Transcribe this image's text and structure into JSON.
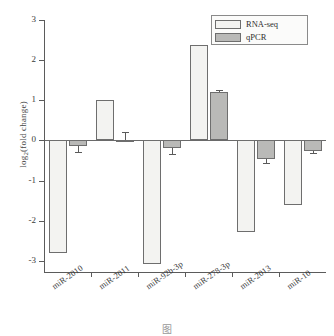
{
  "chart_data": {
    "type": "bar",
    "title": "",
    "xlabel": "",
    "ylabel": "log2(fold change)",
    "ylabel_base": "log",
    "ylabel_sub": "2",
    "ylabel_rest": "(fold change)",
    "ylim": [
      -3.3,
      3.0
    ],
    "yticks": [
      3,
      2,
      1,
      0,
      -1,
      -2,
      -3
    ],
    "ytick_labels": [
      "3",
      "2",
      "1",
      "0",
      "-1",
      "-2",
      "-3"
    ],
    "grid": false,
    "legend_position": "top-right",
    "categories": [
      "miR-2010",
      "miR-2011",
      "miR-92b-3p",
      "miR-278-3p",
      "miR-2013",
      "miR-10"
    ],
    "series": [
      {
        "name": "RNA-seq",
        "color": "#f3f3f1",
        "values": [
          -2.8,
          1.0,
          -3.07,
          2.38,
          -2.28,
          -1.6
        ],
        "errors": [
          0,
          0,
          0,
          0,
          0,
          0
        ]
      },
      {
        "name": "qPCR",
        "color": "#b9b9b7",
        "values": [
          -0.14,
          0.02,
          -0.18,
          1.2,
          -0.45,
          -0.25
        ],
        "errors": [
          0.14,
          0.2,
          0.16,
          0.05,
          0.12,
          0.05
        ]
      }
    ]
  },
  "legend": {
    "items": [
      {
        "label": "RNA-seq",
        "swatch": "rnaseq"
      },
      {
        "label": "qPCR",
        "swatch": "qpcr"
      }
    ]
  },
  "caption": {
    "text": "图"
  }
}
